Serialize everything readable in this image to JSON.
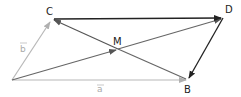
{
  "diagram": {
    "type": "vector-parallelogram",
    "colors": {
      "dark": "#333333",
      "medium": "#666666",
      "light": "#b0b0b0",
      "background": "#ffffff"
    },
    "points": {
      "A": {
        "label": "",
        "x": 12,
        "y": 80
      },
      "C": {
        "label": "C",
        "x": 52,
        "y": 19
      },
      "D": {
        "label": "D",
        "x": 223,
        "y": 18
      },
      "B": {
        "label": "B",
        "x": 188,
        "y": 80
      },
      "M": {
        "label": "M",
        "x": 118,
        "y": 49
      }
    },
    "vectors": [
      {
        "from": "A",
        "to": "B",
        "label": "a⃗",
        "label_text": "a",
        "style": "light"
      },
      {
        "from": "A",
        "to": "C",
        "label": "b⃗",
        "label_text": "b",
        "style": "light"
      },
      {
        "from": "A",
        "to": "M",
        "label": "",
        "style": "medium"
      },
      {
        "from": "M",
        "to": "C",
        "label": "",
        "style": "medium"
      },
      {
        "from": "M",
        "to": "D",
        "label": "",
        "style": "medium"
      },
      {
        "from": "M",
        "to": "B",
        "label": "",
        "style": "medium"
      },
      {
        "from": "C",
        "to": "D",
        "label": "",
        "style": "dark"
      },
      {
        "from": "D",
        "to": "B",
        "label": "",
        "style": "dark"
      }
    ],
    "labels": {
      "C": "C",
      "D": "D",
      "B": "B",
      "M": "M",
      "vec_a": "a",
      "vec_b": "b"
    }
  }
}
